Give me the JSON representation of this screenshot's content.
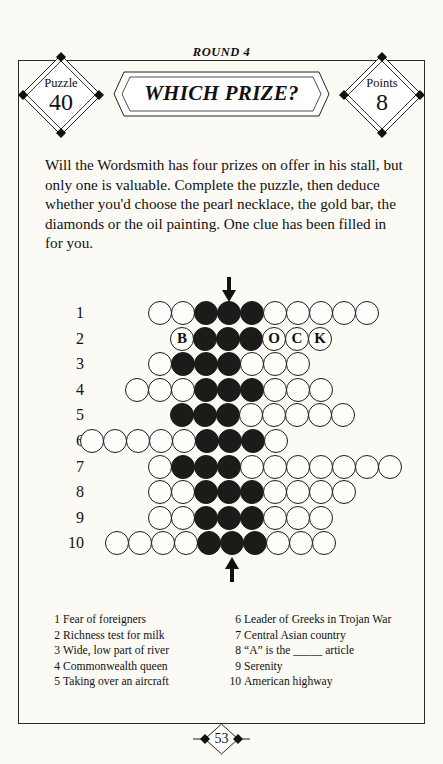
{
  "header": {
    "round_label": "ROUND 4",
    "banner_title": "WHICH PRIZE?",
    "puzzle_badge": {
      "label": "Puzzle",
      "value": "40"
    },
    "points_badge": {
      "label": "Points",
      "value": "8"
    }
  },
  "intro": "Will the Wordsmith has four prizes on offer in his stall, but only one is valuable. Complete the puzzle, then deduce whether you'd choose the pearl necklace, the gold bar, the diamonds or the oil painting. One clue has been filled in for you.",
  "grid": {
    "row_numbers": [
      "1",
      "2",
      "3",
      "4",
      "5",
      "6",
      "7",
      "8",
      "9",
      "10"
    ],
    "rows": [
      {
        "number": "1",
        "left": 148,
        "cells": [
          "w",
          "w",
          "d",
          "d",
          "d",
          "w",
          "w",
          "w",
          "w",
          "w"
        ]
      },
      {
        "number": "2",
        "left": 170,
        "cells": [
          "B",
          "d",
          "d",
          "d",
          "O",
          "C",
          "K"
        ]
      },
      {
        "number": "3",
        "left": 148,
        "cells": [
          "w",
          "d",
          "d",
          "d",
          "w",
          "w",
          "w"
        ]
      },
      {
        "number": "4",
        "left": 125,
        "cells": [
          "w",
          "w",
          "w",
          "d",
          "d",
          "d",
          "w",
          "w",
          "w"
        ]
      },
      {
        "number": "5",
        "left": 170,
        "cells": [
          "d",
          "d",
          "d",
          "w",
          "w",
          "w",
          "w",
          "w"
        ]
      },
      {
        "number": "6",
        "left": 80,
        "cells": [
          "w",
          "w",
          "w",
          "w",
          "w",
          "d",
          "d",
          "d",
          "w"
        ]
      },
      {
        "number": "7",
        "left": 148,
        "cells": [
          "w",
          "d",
          "d",
          "d",
          "w",
          "w",
          "w",
          "w",
          "w",
          "w",
          "w"
        ]
      },
      {
        "number": "8",
        "left": 148,
        "cells": [
          "w",
          "w",
          "d",
          "d",
          "d",
          "w",
          "w",
          "w",
          "w"
        ]
      },
      {
        "number": "9",
        "left": 148,
        "cells": [
          "w",
          "w",
          "d",
          "d",
          "d",
          "w",
          "w",
          "w"
        ]
      },
      {
        "number": "10",
        "left": 105,
        "cells": [
          "w",
          "w",
          "w",
          "w",
          "d",
          "d",
          "d",
          "w",
          "w",
          "w"
        ]
      }
    ],
    "letters": {
      "b": "B",
      "o": "O",
      "c": "C",
      "k": "K"
    },
    "arrow_top_name": "arrow-down-indicator",
    "arrow_bottom_name": "arrow-up-indicator"
  },
  "clues": {
    "column_left": [
      {
        "n": "1",
        "text": "Fear of foreigners"
      },
      {
        "n": "2",
        "text": "Richness test for milk"
      },
      {
        "n": "3",
        "text": "Wide, low part of river"
      },
      {
        "n": "4",
        "text": "Commonwealth queen"
      },
      {
        "n": "5",
        "text": "Taking over an aircraft"
      }
    ],
    "column_right": [
      {
        "n": "6",
        "text": "Leader of Greeks in Trojan War"
      },
      {
        "n": "7",
        "text": "Central Asian country"
      },
      {
        "n": "8",
        "text": "“A” is the _____ article"
      },
      {
        "n": "9",
        "text": "Serenity"
      },
      {
        "n": "10",
        "text": "American highway"
      }
    ]
  },
  "footer": {
    "page_number": "53"
  },
  "colors": {
    "ink": "#1d1b1a",
    "paper": "#fbfaf5"
  }
}
